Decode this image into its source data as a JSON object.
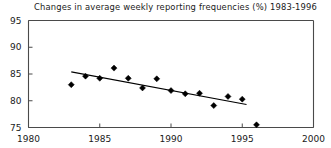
{
  "chart_data": {
    "type": "scatter",
    "title": "Changes in average weekly reporting frequencies (%) 1983-1996",
    "xlabel": "",
    "ylabel": "",
    "xlim": [
      1980,
      2000
    ],
    "ylim": [
      75,
      95
    ],
    "grid": false,
    "legend": null,
    "x_ticks": [
      1980,
      1985,
      1990,
      1995,
      2000
    ],
    "y_ticks": [
      75,
      80,
      85,
      90,
      95
    ],
    "x_tick_labels": [
      "1980",
      "1985",
      "1990",
      "1995",
      "2000"
    ],
    "y_tick_labels": [
      "75",
      "80",
      "85",
      "90",
      "95"
    ],
    "marker": "diamond",
    "series": [
      {
        "name": "Average weekly reporting frequency (%)",
        "x": [
          1983,
          1984,
          1985,
          1986,
          1987,
          1988,
          1989,
          1990,
          1991,
          1992,
          1993,
          1994,
          1995,
          1996
        ],
        "values": [
          83.0,
          84.6,
          84.2,
          86.1,
          84.2,
          82.4,
          84.1,
          81.9,
          81.3,
          81.4,
          79.1,
          80.8,
          80.3,
          75.5
        ]
      }
    ],
    "trend_line": {
      "name": "linear trend",
      "x_start": 1983.0,
      "y_start": 85.4,
      "x_end": 1995.3,
      "y_end": 79.3
    }
  },
  "axes": {
    "x_axis_name": "year-axis",
    "y_axis_name": "percent-axis"
  }
}
